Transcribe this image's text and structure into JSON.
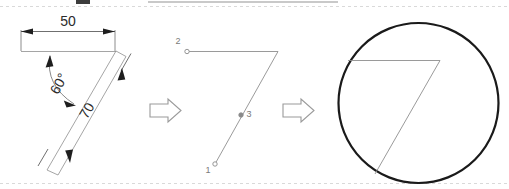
{
  "figure": {
    "background_color": "#ffffff",
    "line_color": "#8e8e8e",
    "circle_color": "#1a1a1a",
    "text_color": "#2b2b2b",
    "label_color": "#7a7a7a"
  },
  "panels": [
    {
      "id": "panel-dimensioned-sketch",
      "name": "dimensioned-sketch",
      "caption": "",
      "dimensions": [
        {
          "name": "length-50",
          "label": "50",
          "value": 50,
          "orientation": "horizontal"
        },
        {
          "name": "angle-60",
          "label": "60°",
          "value": 60,
          "unit": "degrees",
          "orientation": "arc"
        },
        {
          "name": "length-70",
          "label": "70",
          "value": 70,
          "orientation": "diagonal"
        }
      ]
    },
    {
      "id": "panel-polyline-points",
      "name": "polyline-points",
      "caption": "",
      "points": [
        {
          "name": "point-1",
          "label": "1",
          "marker": "hollow-circle",
          "position": "bottom-left"
        },
        {
          "name": "point-2",
          "label": "2",
          "marker": "hollow-circle",
          "position": "top-left"
        },
        {
          "name": "point-3",
          "label": "3",
          "marker": "filled-circle",
          "position": "middle"
        }
      ]
    },
    {
      "id": "panel-inscribed-circle",
      "name": "inscribed-circle",
      "caption": "",
      "shapes": [
        {
          "name": "bounding-circle",
          "type": "circle"
        },
        {
          "name": "seven-polyline",
          "type": "polyline"
        }
      ]
    }
  ],
  "arrows": [
    {
      "name": "step-arrow-1",
      "label": "⇒",
      "direction": "right"
    },
    {
      "name": "step-arrow-2",
      "label": "⇒",
      "direction": "right"
    }
  ]
}
